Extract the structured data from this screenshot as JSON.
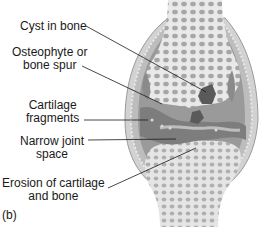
{
  "figure": {
    "panel_label": "(b)",
    "labels": [
      {
        "id": "cyst",
        "line1": "Cyst in bone",
        "line2": ""
      },
      {
        "id": "osteophyte",
        "line1": "Osteophyte or",
        "line2": "bone spur"
      },
      {
        "id": "cartilage",
        "line1": "Cartilage",
        "line2": "fragments"
      },
      {
        "id": "narrow",
        "line1": "Narrow joint",
        "line2": "space"
      },
      {
        "id": "erosion",
        "line1": "Erosion of cartilage",
        "line2": "and bone"
      }
    ]
  },
  "colors": {
    "bone_light": "#e9e9e9",
    "bone_pore": "#a6a6a6",
    "capsule": "#8f8f8f",
    "joint_dark": "#7d7d7d",
    "cyst": "#5a5a5a",
    "membrane_light": "#cfcfcf",
    "leader_line": "#1a1a1a"
  }
}
